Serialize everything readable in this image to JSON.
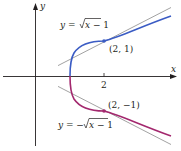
{
  "figure": {
    "axes": {
      "x_label": "x",
      "y_label": "y",
      "x_tick_label": "2"
    },
    "curves": [
      {
        "name": "upper",
        "label": "y = √x − 1",
        "label_prefix": "y = ",
        "label_radicand": "x − 1",
        "color": "#3b5cc4"
      },
      {
        "name": "lower",
        "label": "y = −√x − 1",
        "label_prefix": "y = −",
        "label_radicand": "x − 1",
        "color": "#a3286e"
      }
    ],
    "points": [
      {
        "label": "(2, 1)",
        "x": 2,
        "y": 1
      },
      {
        "label": "(2, −1)",
        "x": 2,
        "y": -1
      }
    ],
    "tangent_color": "#8a8a8a",
    "axis_color": "#231f20"
  }
}
